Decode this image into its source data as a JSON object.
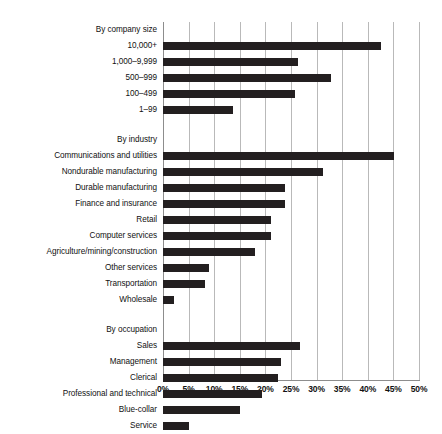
{
  "chart_data": {
    "type": "bar",
    "orientation": "horizontal",
    "title": "",
    "subtitle": "",
    "xlabel": "",
    "ylabel": "",
    "xlim": [
      0,
      50
    ],
    "xtick_labels": [
      "0%",
      "5%",
      "10%",
      "15%",
      "20%",
      "25%",
      "30%",
      "35%",
      "40%",
      "45%",
      "50%"
    ],
    "xtick_values": [
      0,
      5,
      10,
      15,
      20,
      25,
      30,
      35,
      40,
      45,
      50
    ],
    "grid": true,
    "legend": false,
    "bar_color": "#231f20",
    "grid_color": "#b9b9b9",
    "axis_color": "#8d8d8d",
    "groups": [
      {
        "name": "By company size",
        "categories": [
          "10,000+",
          "1,000–9,999",
          "500–999",
          "100–499",
          "1–99"
        ],
        "values": [
          42.6,
          26.3,
          32.8,
          25.8,
          13.7
        ]
      },
      {
        "name": "By industry",
        "categories": [
          "Communications and utilities",
          "Nondurable manufacturing",
          "Durable manufacturing",
          "Finance and insurance",
          "Retail",
          "Computer services",
          "Agriculture/mining/construction",
          "Other services",
          "Transportation",
          "Wholesale"
        ],
        "values": [
          45.1,
          31.3,
          23.8,
          23.8,
          21.0,
          21.1,
          18.0,
          9.0,
          8.2,
          2.1
        ]
      },
      {
        "name": "By occupation",
        "categories": [
          "Sales",
          "Management",
          "Clerical",
          "Professional and technical",
          "Blue-collar",
          "Service"
        ],
        "values": [
          26.7,
          23.1,
          22.4,
          19.3,
          15.0,
          5.1
        ]
      }
    ]
  }
}
